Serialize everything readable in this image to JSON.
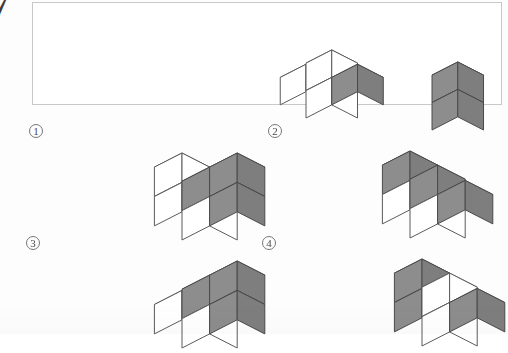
{
  "page": {
    "question_number": "7",
    "background_color": "#fdfdfd",
    "width": 508,
    "height": 334
  },
  "colors": {
    "gray_top": "#9a9a9a",
    "gray_left": "#8d8d8d",
    "gray_right": "#7e7e7e",
    "white_face": "#ffffff",
    "outline": "#5a5a5a",
    "box_border": "#c9c9c9"
  },
  "prompt_box": {
    "name": "prompt-box",
    "left": 32,
    "top": 2,
    "width": 470,
    "height": 103
  },
  "figures": [
    {
      "id": "prompt-figure-1",
      "label": "",
      "origin": {
        "left": 196,
        "top": 8
      },
      "cube_size": 28,
      "cubes": [
        {
          "x": 0,
          "y": 0,
          "z": 1,
          "shade": "white"
        },
        {
          "x": 0,
          "y": 0,
          "z": 0,
          "shade": "white"
        },
        {
          "x": -1,
          "y": 0,
          "z": 0,
          "shade": "white"
        },
        {
          "x": 0,
          "y": 1,
          "z": 0,
          "shade": "gray"
        }
      ]
    },
    {
      "id": "prompt-figure-2",
      "label": "",
      "origin": {
        "left": 322,
        "top": 20
      },
      "cube_size": 28,
      "cubes": [
        {
          "x": 0,
          "y": 0,
          "z": 1,
          "shade": "gray"
        },
        {
          "x": 0,
          "y": 0,
          "z": 0,
          "shade": "gray"
        }
      ]
    }
  ],
  "options": [
    {
      "id": "option-1",
      "label": "1",
      "label_pos": {
        "left": 29,
        "top": 124
      },
      "origin": {
        "left": 72,
        "top": 130
      },
      "cube_size": 30,
      "cubes": [
        {
          "x": 0,
          "y": 0,
          "z": 1,
          "shade": "gray"
        },
        {
          "x": 0,
          "y": 1,
          "z": 1,
          "shade": "gray"
        },
        {
          "x": -1,
          "y": 0,
          "z": 1,
          "shade": "white"
        },
        {
          "x": 0,
          "y": 0,
          "z": 0,
          "shade": "white"
        },
        {
          "x": 0,
          "y": 1,
          "z": 0,
          "shade": "gray"
        },
        {
          "x": -1,
          "y": 0,
          "z": 0,
          "shade": "white"
        }
      ]
    },
    {
      "id": "option-2",
      "label": "2",
      "label_pos": {
        "left": 268,
        "top": 124
      },
      "origin": {
        "left": 300,
        "top": 128
      },
      "cube_size": 30,
      "cubes": [
        {
          "x": 0,
          "y": 0,
          "z": 1,
          "shade": "gray"
        },
        {
          "x": -1,
          "y": 0,
          "z": 1,
          "shade": "gray"
        },
        {
          "x": 0,
          "y": 1,
          "z": 0,
          "shade": "gray"
        },
        {
          "x": 0,
          "y": 0,
          "z": 0,
          "shade": "white"
        },
        {
          "x": -1,
          "y": 0,
          "z": 0,
          "shade": "white"
        }
      ]
    },
    {
      "id": "option-3",
      "label": "3",
      "label_pos": {
        "left": 26,
        "top": 236
      },
      "origin": {
        "left": 72,
        "top": 238
      },
      "cube_size": 30,
      "cubes": [
        {
          "x": 0,
          "y": 0,
          "z": 1,
          "shade": "gray"
        },
        {
          "x": 0,
          "y": 1,
          "z": 1,
          "shade": "gray"
        },
        {
          "x": 0,
          "y": 1,
          "z": 0,
          "shade": "gray"
        },
        {
          "x": 0,
          "y": 0,
          "z": 0,
          "shade": "white"
        },
        {
          "x": -1,
          "y": 0,
          "z": 0,
          "shade": "white"
        }
      ]
    },
    {
      "id": "option-4",
      "label": "4",
      "label_pos": {
        "left": 262,
        "top": 236
      },
      "origin": {
        "left": 312,
        "top": 236
      },
      "cube_size": 30,
      "cubes": [
        {
          "x": 0,
          "y": 0,
          "z": 1,
          "shade": "white"
        },
        {
          "x": -1,
          "y": 0,
          "z": 1,
          "shade": "gray"
        },
        {
          "x": 0,
          "y": 1,
          "z": 0,
          "shade": "gray"
        },
        {
          "x": 0,
          "y": 0,
          "z": 0,
          "shade": "white"
        },
        {
          "x": -1,
          "y": 0,
          "z": 0,
          "shade": "gray"
        }
      ]
    }
  ]
}
